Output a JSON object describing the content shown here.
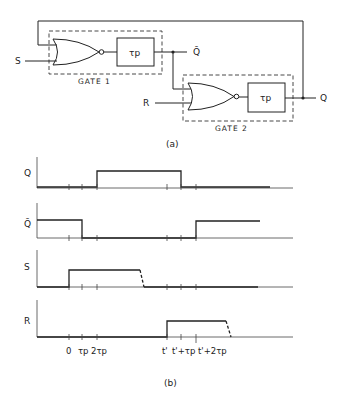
{
  "circuit": {
    "gate1": {
      "label": "GATE 1",
      "delay_label": "τp"
    },
    "gate2": {
      "label": "GATE 2",
      "delay_label": "τp"
    },
    "inputs": {
      "s": "S",
      "r": "R"
    },
    "outputs": {
      "q_bar": "Q̄",
      "q": "Q"
    },
    "caption": "(a)"
  },
  "timing": {
    "caption": "(b)",
    "signals": [
      {
        "name": "Q",
        "label": "Q"
      },
      {
        "name": "Q_bar",
        "label": "Q̄"
      },
      {
        "name": "S",
        "label": "S"
      },
      {
        "name": "R",
        "label": "R"
      }
    ],
    "tick_labels": [
      "0",
      "τp",
      "2τp",
      "t'",
      "t'+τp",
      "t'+2τp"
    ]
  },
  "colors": {
    "ink": "#222222",
    "background": "#ffffff"
  }
}
